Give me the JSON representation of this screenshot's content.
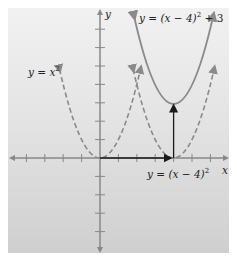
{
  "figure": {
    "axes": {
      "x_label": "x",
      "y_label": "y",
      "unit_px": 18.4,
      "origin_px": [
        100,
        158
      ],
      "x_ticks": [
        -4,
        -3,
        -2,
        -1,
        1,
        2,
        3,
        4,
        5,
        6
      ],
      "y_ticks": [
        -5,
        -4,
        -3,
        -2,
        -1,
        1,
        2,
        3,
        4,
        5,
        6,
        7
      ]
    },
    "curves": [
      {
        "id": "base",
        "equation": "y = x^2",
        "label": "y = x",
        "label_sup": "2",
        "style": "dashed",
        "vertex": [
          0,
          0
        ]
      },
      {
        "id": "shift-right",
        "equation": "y = (x - 4)^2",
        "label": "y = (x − 4)",
        "label_sup": "2",
        "style": "dashed",
        "vertex": [
          4,
          0
        ]
      },
      {
        "id": "shift-up",
        "equation": "y = (x - 4)^2 + 3",
        "label_pre": "y = (x − 4)",
        "label_sup": "2",
        "label_post": " + 3",
        "style": "solid",
        "vertex": [
          4,
          3
        ]
      }
    ],
    "arrows": [
      {
        "from": [
          0,
          0
        ],
        "to": [
          4,
          0
        ],
        "meaning": "horizontal shift 4 right"
      },
      {
        "from": [
          4,
          0
        ],
        "to": [
          4,
          3
        ],
        "meaning": "vertical shift 3 up"
      }
    ],
    "colors": {
      "curve": "#8a8a8a",
      "axis": "#888888",
      "arrow": "#1a1a1a",
      "text": "#222222"
    }
  }
}
